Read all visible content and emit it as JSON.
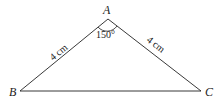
{
  "diagram": {
    "type": "triangle",
    "vertices": {
      "A": {
        "label": "A"
      },
      "B": {
        "label": "B"
      },
      "C": {
        "label": "C"
      }
    },
    "sides": {
      "AB": {
        "label": "4 cm"
      },
      "AC": {
        "label": "4 cm"
      }
    },
    "angles": {
      "A": {
        "label": "150°"
      }
    },
    "colors": {
      "stroke": "#222222",
      "background": "#ffffff"
    }
  }
}
